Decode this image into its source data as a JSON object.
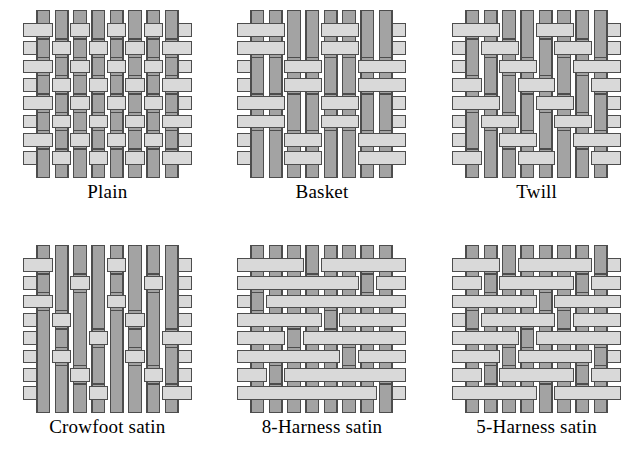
{
  "figure": {
    "background_color": "#ffffff",
    "warp_color": "#a3a3a3",
    "weft_color": "#d9d9d9",
    "outline_color": "#4d4d4d",
    "label_color": "#000000",
    "grid_size": 8,
    "columns": 3,
    "rows": 2
  },
  "weaves": [
    {
      "id": "plain",
      "label": "Plain",
      "type": "plain",
      "repeat": "1/1",
      "matrix": [
        [
          1,
          0,
          1,
          0,
          1,
          0,
          1,
          0
        ],
        [
          0,
          1,
          0,
          1,
          0,
          1,
          0,
          1
        ],
        [
          1,
          0,
          1,
          0,
          1,
          0,
          1,
          0
        ],
        [
          0,
          1,
          0,
          1,
          0,
          1,
          0,
          1
        ],
        [
          1,
          0,
          1,
          0,
          1,
          0,
          1,
          0
        ],
        [
          0,
          1,
          0,
          1,
          0,
          1,
          0,
          1
        ],
        [
          1,
          0,
          1,
          0,
          1,
          0,
          1,
          0
        ],
        [
          0,
          1,
          0,
          1,
          0,
          1,
          0,
          1
        ]
      ]
    },
    {
      "id": "basket",
      "label": "Basket",
      "type": "basket",
      "repeat": "2/2",
      "matrix": [
        [
          1,
          1,
          0,
          0,
          1,
          1,
          0,
          0
        ],
        [
          1,
          1,
          0,
          0,
          1,
          1,
          0,
          0
        ],
        [
          0,
          0,
          1,
          1,
          0,
          0,
          1,
          1
        ],
        [
          0,
          0,
          1,
          1,
          0,
          0,
          1,
          1
        ],
        [
          1,
          1,
          0,
          0,
          1,
          1,
          0,
          0
        ],
        [
          1,
          1,
          0,
          0,
          1,
          1,
          0,
          0
        ],
        [
          0,
          0,
          1,
          1,
          0,
          0,
          1,
          1
        ],
        [
          0,
          0,
          1,
          1,
          0,
          0,
          1,
          1
        ]
      ]
    },
    {
      "id": "twill",
      "label": "Twill",
      "type": "twill",
      "repeat": "2/2 twill",
      "matrix": [
        [
          1,
          1,
          0,
          0,
          1,
          1,
          0,
          0
        ],
        [
          0,
          1,
          1,
          0,
          0,
          1,
          1,
          0
        ],
        [
          0,
          0,
          1,
          1,
          0,
          0,
          1,
          1
        ],
        [
          1,
          0,
          0,
          1,
          1,
          0,
          0,
          1
        ],
        [
          1,
          1,
          0,
          0,
          1,
          1,
          0,
          0
        ],
        [
          0,
          1,
          1,
          0,
          0,
          1,
          1,
          0
        ],
        [
          0,
          0,
          1,
          1,
          0,
          0,
          1,
          1
        ],
        [
          1,
          0,
          0,
          1,
          1,
          0,
          0,
          1
        ]
      ]
    },
    {
      "id": "crowfoot-satin",
      "label": "Crowfoot satin",
      "type": "satin",
      "repeat": "4-harness",
      "matrix": [
        [
          1,
          0,
          0,
          0,
          1,
          0,
          0,
          0
        ],
        [
          0,
          0,
          1,
          0,
          0,
          0,
          1,
          0
        ],
        [
          1,
          0,
          0,
          0,
          1,
          0,
          0,
          0
        ],
        [
          0,
          1,
          0,
          0,
          0,
          1,
          0,
          0
        ],
        [
          0,
          0,
          0,
          1,
          0,
          0,
          0,
          1
        ],
        [
          0,
          1,
          0,
          0,
          0,
          1,
          0,
          0
        ],
        [
          0,
          0,
          1,
          0,
          0,
          0,
          1,
          0
        ],
        [
          0,
          0,
          0,
          1,
          0,
          0,
          0,
          1
        ]
      ]
    },
    {
      "id": "8-harness-satin",
      "label": "8-Harness satin",
      "type": "satin",
      "repeat": "8-harness",
      "matrix": [
        [
          1,
          1,
          1,
          0,
          1,
          1,
          1,
          1
        ],
        [
          1,
          1,
          1,
          1,
          1,
          1,
          0,
          1
        ],
        [
          0,
          1,
          1,
          1,
          1,
          1,
          1,
          1
        ],
        [
          1,
          1,
          1,
          1,
          0,
          1,
          1,
          1
        ],
        [
          1,
          1,
          0,
          1,
          1,
          1,
          1,
          1
        ],
        [
          1,
          1,
          1,
          1,
          1,
          0,
          1,
          1
        ],
        [
          1,
          0,
          1,
          1,
          1,
          1,
          1,
          1
        ],
        [
          1,
          1,
          1,
          1,
          1,
          1,
          1,
          0
        ]
      ]
    },
    {
      "id": "5-harness-satin",
      "label": "5-Harness satin",
      "type": "satin",
      "repeat": "5-harness",
      "matrix": [
        [
          1,
          1,
          0,
          1,
          1,
          1,
          1,
          0
        ],
        [
          1,
          0,
          1,
          1,
          1,
          1,
          0,
          1
        ],
        [
          1,
          1,
          1,
          1,
          0,
          1,
          1,
          1
        ],
        [
          0,
          1,
          1,
          1,
          1,
          0,
          1,
          1
        ],
        [
          1,
          1,
          1,
          0,
          1,
          1,
          1,
          1
        ],
        [
          1,
          1,
          0,
          1,
          1,
          1,
          1,
          0
        ],
        [
          1,
          0,
          1,
          1,
          1,
          1,
          0,
          1
        ],
        [
          1,
          1,
          1,
          1,
          0,
          1,
          1,
          1
        ]
      ]
    }
  ]
}
